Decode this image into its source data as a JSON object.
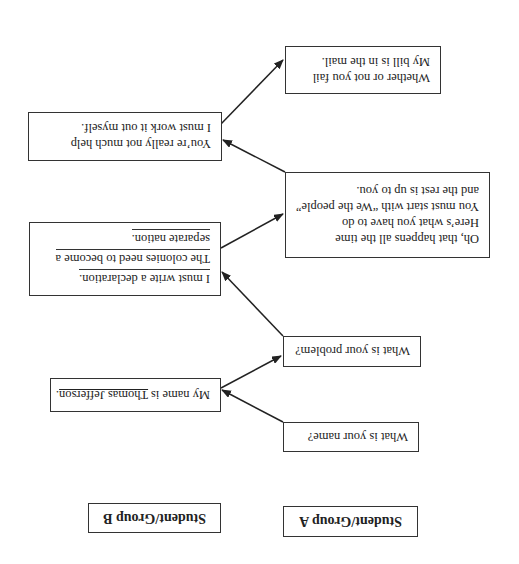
{
  "headers": {
    "group_a": "Student/Group A",
    "group_b": "Student/Group B"
  },
  "group_a": {
    "q1": "What is your name?",
    "q2": "What is your problem?",
    "q3_lines": [
      "Oh, that happens all the time",
      "Here’s what you have to do",
      "You must start with “We the people”",
      "and the rest is up to you."
    ],
    "q4_lines": [
      "Whether or not you fail",
      "My bill is in the mail."
    ]
  },
  "group_b": {
    "a1_prefix": "My name is ",
    "a1_name": "Thomas Jefferson",
    "a1_suffix": ".",
    "a2_lines": [
      "I must write a declaration.",
      "The colonies need to become a",
      "separate nation."
    ],
    "a3_lines": [
      "You’re really not much help",
      "I must work it out myself."
    ]
  },
  "display": {
    "orientation": "rotated 180 degrees",
    "line_color": "#333333"
  }
}
